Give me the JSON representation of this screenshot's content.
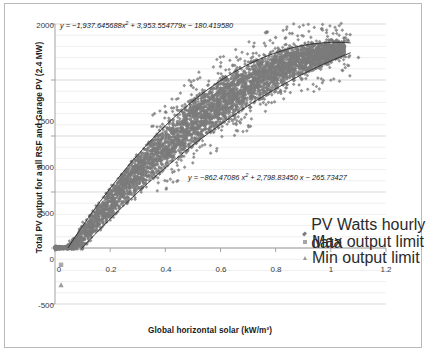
{
  "chart_data": {
    "type": "scatter",
    "title": "",
    "xlabel": "Global horizontal solar (kW/m²)",
    "ylabel": "Total PV output for a all RSF and Garage PV (2.4 MW)",
    "xlim": [
      0,
      1.2
    ],
    "ylim": [
      -500,
      2000
    ],
    "xticks": [
      "0",
      "0.2",
      "0.4",
      "0.6",
      "0.8",
      "1",
      "1.2"
    ],
    "xtick_values": [
      0,
      0.2,
      0.4,
      0.6,
      0.8,
      1.0,
      1.2
    ],
    "yticks": [
      "-500",
      "0",
      "500",
      "1000",
      "1500",
      "2000"
    ],
    "ytick_values": [
      -500,
      0,
      500,
      1000,
      1500,
      2000
    ],
    "grid": "horizontal minor gridlines every 100 units",
    "legend_position": "inside lower right",
    "series": [
      {
        "name": "PV Watts hourly data",
        "marker": "diamond",
        "color": "#7b7b7b",
        "point_count_approx": 4000,
        "description": "Dense cloud of hourly points forming an upward-curving band from (0,0) to about (1.05,1800); scattered outliers above and below the band."
      },
      {
        "name": "Max output limit",
        "marker": "square",
        "color": "#a6a6a6",
        "curve": "quadratic",
        "coefficients": {
          "a": -1937.645688,
          "b": 3953.554779,
          "c": -180.41958
        },
        "x_range": [
          0.05,
          1.06
        ]
      },
      {
        "name": "Min output limit",
        "marker": "triangle",
        "color": "#9a9a9a",
        "curve": "quadratic",
        "coefficients": {
          "a": -862.47086,
          "b": 2798.8345,
          "c": -265.73427
        },
        "x_range": [
          0.1,
          1.06
        ]
      }
    ],
    "annotations": [
      {
        "id": "eq_max",
        "text": "y = −1,937.645688x² + 3,953.554779x − 180.419580",
        "x_px": 60,
        "y_px": 24
      },
      {
        "id": "eq_min",
        "text": "y = −862.47086 x² + 2,798.83450 x − 265.73427",
        "x_px": 188,
        "y_px": 176
      }
    ]
  },
  "legend": {
    "items": [
      {
        "label": "PV Watts hourly data",
        "marker": "diamond-marker"
      },
      {
        "label": "Max output limit",
        "marker": "square-marker"
      },
      {
        "label": "Min output limit",
        "marker": "triangle-marker"
      }
    ]
  },
  "colors": {
    "scatter": "#7b7b7b",
    "trendline": "#2f2f2f",
    "gridline": "#e2e2e2",
    "axis": "#9a9a9a",
    "frame": "#b9b9b9",
    "text": "#1a1a1a"
  }
}
